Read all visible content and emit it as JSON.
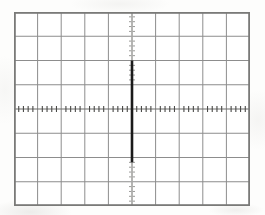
{
  "figure": {
    "kind": "oscilloscope-graticule",
    "title": "Oscilloscope display",
    "background_color": "#ffffff",
    "paper_color": "#fdfdfc",
    "graticule_color": "#8d8d8d",
    "border_color": "#7a7a78",
    "axis_color": "#6d6d6b",
    "trace_color": "#1b1b1b",
    "tick_color": "#4a4a48"
  },
  "chart_data": {
    "type": "line",
    "title": "",
    "subtitle": "",
    "xlabel": "",
    "ylabel": "",
    "xlim": [
      -5,
      5
    ],
    "ylim": [
      -4,
      4
    ],
    "grid": true,
    "legend": "none",
    "x_major_divisions": 10,
    "y_major_divisions": 8,
    "minor_ticks_per_division": 5,
    "x_tick_labels": [],
    "y_tick_labels": [],
    "annotations": [],
    "series": [
      {
        "name": "impulse",
        "style": "vertical-impulse",
        "x": [
          0,
          0
        ],
        "values": [
          2.0,
          -2.2
        ],
        "x_position_div": 0,
        "top_div": 2.0,
        "bottom_div": -2.2
      },
      {
        "name": "impulse-tail-upper",
        "style": "faint-dotted",
        "x": [
          0,
          0
        ],
        "values": [
          4.0,
          2.0
        ]
      },
      {
        "name": "impulse-tail-lower",
        "style": "faint-dotted",
        "x": [
          0,
          0
        ],
        "values": [
          -2.2,
          -4.0
        ]
      }
    ]
  },
  "geometry": {
    "screen_left": 14,
    "screen_top": 12,
    "screen_width": 236,
    "screen_height": 194,
    "center_x": 132,
    "center_y": 109,
    "cell_width": 23.6,
    "cell_height": 24.25,
    "trace_top_y": 55,
    "trace_bottom_y": 160
  }
}
